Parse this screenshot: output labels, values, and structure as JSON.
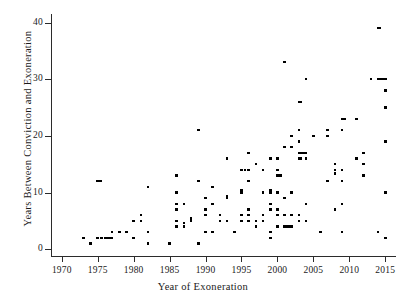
{
  "chart_data": {
    "type": "scatter",
    "title": "",
    "xlabel": "Year of Exoneration",
    "ylabel": "Years Between Conviction and Exoneration",
    "xlim": [
      1968.5,
      2016.5
    ],
    "ylim": [
      -1.2,
      41.5
    ],
    "xticks": [
      1970,
      1975,
      1980,
      1985,
      1990,
      1995,
      2000,
      2005,
      2010,
      2015
    ],
    "yticks": [
      0,
      10,
      20,
      30,
      40
    ],
    "xtick_labels": [
      "1970",
      "1975",
      "1980",
      "1985",
      "1990",
      "1995",
      "2000",
      "2005",
      "2010",
      "2015"
    ],
    "ytick_labels": [
      "0",
      "10",
      "20",
      "30",
      "40"
    ],
    "grid": false,
    "legend": false,
    "marker": "square",
    "marker_color": "#000000",
    "points": [
      [
        1973,
        2
      ],
      [
        1974,
        1
      ],
      [
        1975,
        12
      ],
      [
        1975,
        2
      ],
      [
        1975.4,
        12
      ],
      [
        1975.5,
        2
      ],
      [
        1976,
        2
      ],
      [
        1976.3,
        2
      ],
      [
        1976.6,
        2
      ],
      [
        1977,
        2
      ],
      [
        1977,
        3
      ],
      [
        1978,
        3
      ],
      [
        1979,
        3
      ],
      [
        1980,
        5
      ],
      [
        1980,
        2
      ],
      [
        1981,
        6
      ],
      [
        1981,
        5
      ],
      [
        1982,
        3
      ],
      [
        1982,
        11
      ],
      [
        1982,
        1
      ],
      [
        1985,
        1
      ],
      [
        1986,
        13
      ],
      [
        1986,
        10
      ],
      [
        1986,
        8
      ],
      [
        1986,
        7
      ],
      [
        1986,
        5
      ],
      [
        1986,
        4
      ],
      [
        1987,
        8
      ],
      [
        1987,
        4
      ],
      [
        1987,
        4.6
      ],
      [
        1988,
        5
      ],
      [
        1988,
        5.4
      ],
      [
        1989,
        21
      ],
      [
        1989,
        12
      ],
      [
        1989,
        1
      ],
      [
        1990,
        9
      ],
      [
        1990,
        7
      ],
      [
        1990,
        6
      ],
      [
        1990,
        3
      ],
      [
        1991,
        11
      ],
      [
        1991,
        8
      ],
      [
        1991,
        3
      ],
      [
        1992,
        6
      ],
      [
        1992,
        5
      ],
      [
        1993,
        16
      ],
      [
        1993,
        9
      ],
      [
        1993,
        9.4
      ],
      [
        1993,
        5
      ],
      [
        1994,
        3
      ],
      [
        1995,
        14
      ],
      [
        1995,
        10
      ],
      [
        1995,
        10.4
      ],
      [
        1995,
        6
      ],
      [
        1995,
        5
      ],
      [
        1995.5,
        14
      ],
      [
        1996,
        17
      ],
      [
        1996,
        14
      ],
      [
        1996,
        12
      ],
      [
        1996,
        7
      ],
      [
        1996,
        6
      ],
      [
        1996,
        5
      ],
      [
        1997,
        15
      ],
      [
        1997,
        5
      ],
      [
        1997,
        4
      ],
      [
        1998,
        14
      ],
      [
        1998,
        10
      ],
      [
        1998,
        6
      ],
      [
        1998,
        5
      ],
      [
        1999,
        16
      ],
      [
        1999,
        10
      ],
      [
        1999,
        10.4
      ],
      [
        1999,
        8
      ],
      [
        1999,
        7
      ],
      [
        1999,
        3
      ],
      [
        1999,
        2
      ],
      [
        2000,
        16
      ],
      [
        2000,
        14
      ],
      [
        2000,
        13
      ],
      [
        2000.2,
        13
      ],
      [
        2000.4,
        13
      ],
      [
        2000,
        10
      ],
      [
        2000,
        7
      ],
      [
        2000,
        6
      ],
      [
        2000,
        4
      ],
      [
        2001,
        33
      ],
      [
        2001,
        18
      ],
      [
        2001,
        9
      ],
      [
        2001,
        6
      ],
      [
        2001,
        4
      ],
      [
        2001.4,
        4
      ],
      [
        2001.8,
        4
      ],
      [
        2002,
        18
      ],
      [
        2002,
        20
      ],
      [
        2002,
        10
      ],
      [
        2002,
        6
      ],
      [
        2002,
        4
      ],
      [
        2003,
        26
      ],
      [
        2003.3,
        26
      ],
      [
        2003,
        21
      ],
      [
        2003,
        19
      ],
      [
        2003,
        17
      ],
      [
        2003.3,
        17
      ],
      [
        2003.6,
        17
      ],
      [
        2003,
        16
      ],
      [
        2003.3,
        16
      ],
      [
        2003,
        6
      ],
      [
        2003,
        5
      ],
      [
        2004,
        30
      ],
      [
        2004,
        17
      ],
      [
        2004,
        16
      ],
      [
        2004,
        8
      ],
      [
        2004,
        5
      ],
      [
        2005,
        20
      ],
      [
        2006,
        3
      ],
      [
        2007,
        20
      ],
      [
        2007,
        12
      ],
      [
        2007,
        21
      ],
      [
        2008,
        14
      ],
      [
        2008,
        13.4
      ],
      [
        2008,
        15
      ],
      [
        2008,
        7
      ],
      [
        2009,
        23
      ],
      [
        2009.3,
        23
      ],
      [
        2009,
        21
      ],
      [
        2009,
        14
      ],
      [
        2009,
        12
      ],
      [
        2009,
        8
      ],
      [
        2009,
        3
      ],
      [
        2011,
        23
      ],
      [
        2011,
        16
      ],
      [
        2012,
        17
      ],
      [
        2012,
        15
      ],
      [
        2012,
        13
      ],
      [
        2013,
        30
      ],
      [
        2014,
        39
      ],
      [
        2014.2,
        39
      ],
      [
        2014,
        30
      ],
      [
        2014.3,
        30
      ],
      [
        2014.6,
        30
      ],
      [
        2014,
        3
      ],
      [
        2015,
        30
      ],
      [
        2015,
        28
      ],
      [
        2015,
        25
      ],
      [
        2015,
        19
      ],
      [
        2015,
        10
      ],
      [
        2015,
        2
      ]
    ]
  }
}
